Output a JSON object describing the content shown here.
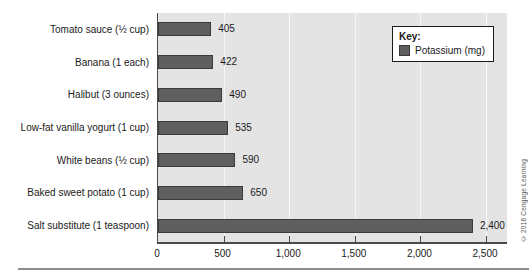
{
  "chart_data": {
    "type": "bar",
    "orientation": "horizontal",
    "categories": [
      "Tomato sauce (½ cup)",
      "Banana (1 each)",
      "Halibut (3 ounces)",
      "Low-fat vanilla yogurt (1 cup)",
      "White beans (½ cup)",
      "Baked sweet potato (1 cup)",
      "Salt substitute (1 teaspoon)"
    ],
    "values": [
      405,
      422,
      490,
      535,
      590,
      650,
      2400
    ],
    "value_labels": [
      "405",
      "422",
      "490",
      "535",
      "590",
      "650",
      "2,400"
    ],
    "x_ticks": [
      {
        "value": 0,
        "label": "0"
      },
      {
        "value": 500,
        "label": "500"
      },
      {
        "value": 1000,
        "label": "1,000"
      },
      {
        "value": 1500,
        "label": "1,500"
      },
      {
        "value": 2000,
        "label": "2,000"
      },
      {
        "value": 2500,
        "label": "2,500"
      }
    ],
    "xlim": [
      0,
      2660
    ],
    "grid": "vertical",
    "legend": {
      "position": "top-right",
      "title": "Key:",
      "entries": [
        {
          "label": "Potassium (mg)",
          "color": "#5f5f5f"
        }
      ]
    }
  },
  "colors": {
    "bar_fill": "#5f5f5f",
    "bar_border": "#3a3a3a",
    "plot_background": "#e4e4e4",
    "gridline": "#f7f7f7",
    "axis": "#4a4a4a",
    "text": "#1a1a1a"
  },
  "footer": {
    "credit": "© 2016 Cengage Learning"
  }
}
